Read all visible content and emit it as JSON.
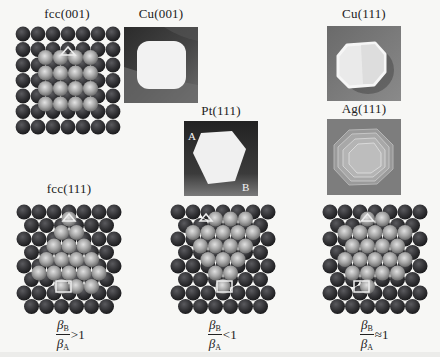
{
  "figure": {
    "panels": [
      {
        "id": "fcc001",
        "label": "fcc(001)",
        "type": "lattice-square",
        "x": 15,
        "y": 26,
        "w": 104,
        "h": 108,
        "label_x": 67,
        "label_y": 9
      },
      {
        "id": "fcc111_left",
        "label": "fcc(111)",
        "type": "lattice-hex",
        "variant": "gt",
        "x": 16,
        "y": 201,
        "w": 104,
        "h": 112,
        "label_x": 68,
        "label_y": 182
      },
      {
        "id": "fcc111_mid",
        "label": "",
        "type": "lattice-hex",
        "variant": "lt",
        "x": 170,
        "y": 201,
        "w": 104,
        "h": 112
      },
      {
        "id": "fcc111_right",
        "label": "",
        "type": "lattice-hex",
        "variant": "eq",
        "x": 322,
        "y": 201,
        "w": 104,
        "h": 112
      }
    ],
    "photos": [
      {
        "id": "cu001",
        "label": "Cu(001)",
        "x": 124,
        "y": 27,
        "w": 74,
        "h": 76,
        "shape": "rounded-square"
      },
      {
        "id": "cu111",
        "label": "Cu(111)",
        "x": 327,
        "y": 26,
        "w": 74,
        "h": 75,
        "shape": "rounded-hexagon"
      },
      {
        "id": "pt111",
        "label": "Pt(111)",
        "x": 184,
        "y": 121,
        "w": 74,
        "h": 75,
        "shape": "hexagon",
        "corner_a": "A",
        "corner_b": "B"
      },
      {
        "id": "ag111",
        "label": "Ag(111)",
        "x": 327,
        "y": 119,
        "w": 74,
        "h": 76,
        "shape": "stacked-hexagon"
      }
    ],
    "formulas": [
      {
        "id": "gt",
        "numerator": "β",
        "num_sub": "B",
        "denominator": "β",
        "den_sub": "A",
        "relation": ">1",
        "x": 56,
        "y": 318
      },
      {
        "id": "lt",
        "numerator": "β",
        "num_sub": "B",
        "denominator": "β",
        "den_sub": "A",
        "relation": "<1",
        "x": 208,
        "y": 318
      },
      {
        "id": "eq",
        "numerator": "β",
        "num_sub": "B",
        "denominator": "β",
        "den_sub": "A",
        "relation": "≈1",
        "x": 360,
        "y": 318
      }
    ]
  },
  "labels": {
    "fcc001": "fcc(001)",
    "cu001": "Cu(001)",
    "cu111": "Cu(111)",
    "pt111": "Pt(111)",
    "ag111": "Ag(111)",
    "fcc111": "fcc(111)",
    "corner_a": "A",
    "corner_b": "B"
  },
  "formulas": {
    "gt": {
      "num": "β",
      "num_sub": "B",
      "den": "β",
      "den_sub": "A",
      "rel": ">1"
    },
    "lt": {
      "num": "β",
      "num_sub": "B",
      "den": "β",
      "den_sub": "A",
      "rel": "<1"
    },
    "eq": {
      "num": "β",
      "num_sub": "B",
      "den": "β",
      "den_sub": "A",
      "rel": "≈1"
    }
  },
  "colors": {
    "background": "#f7f7f5",
    "substrate_atom": "#2f2f32",
    "island_atom": "#a9a9a9",
    "marker": "#e8e8e8"
  }
}
